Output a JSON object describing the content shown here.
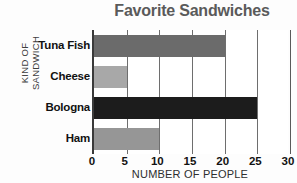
{
  "chart_data": {
    "type": "bar",
    "orientation": "horizontal",
    "title": "Favorite Sandwiches",
    "xlabel": "NUMBER OF PEOPLE",
    "ylabel": "KIND OF SANDWICH",
    "ylabel_lines": [
      "KIND OF",
      "SANDWICH"
    ],
    "categories": [
      "Tuna Fish",
      "Cheese",
      "Bologna",
      "Ham"
    ],
    "values": [
      20,
      5,
      25,
      10
    ],
    "bar_colors": [
      "#6b6b6b",
      "#a8a8a8",
      "#1c1c1c",
      "#969696"
    ],
    "xlim": [
      0,
      30
    ],
    "xticks": [
      0,
      5,
      10,
      15,
      20,
      25,
      30
    ],
    "xtick_labels": [
      "0",
      "5",
      "10",
      "15",
      "20",
      "25",
      "30"
    ],
    "grid": true,
    "grid_axis": "x",
    "legend": false,
    "title_color": "#5a5a5a",
    "axis_color": "#3a3a3a",
    "grid_color": "#6e6e6e"
  }
}
